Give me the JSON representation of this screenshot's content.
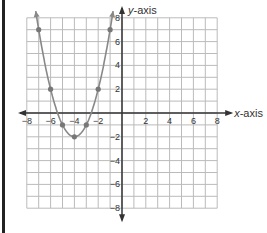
{
  "chart_data": {
    "type": "line",
    "title": "",
    "xlabel": "x-axis",
    "ylabel": "y-axis",
    "xlim": [
      -8,
      8
    ],
    "ylim": [
      -8,
      8
    ],
    "grid": true,
    "x_ticks": [
      "-8",
      "-6",
      "-4",
      "-2",
      "2",
      "4",
      "6",
      "8"
    ],
    "y_ticks": [
      "8",
      "6",
      "4",
      "2",
      "-2",
      "-4",
      "-6",
      "-8"
    ],
    "series": [
      {
        "name": "parabola",
        "equation": "y = (x + 4)^2 - 2",
        "x": [
          -7,
          -6,
          -5,
          -4,
          -3,
          -2,
          -1
        ],
        "y": [
          7,
          2,
          -1,
          -2,
          -1,
          2,
          7
        ],
        "color": "#888888"
      }
    ],
    "legend": null
  },
  "labels": {
    "x_axis": "x-axis",
    "y_axis": "y-axis"
  }
}
